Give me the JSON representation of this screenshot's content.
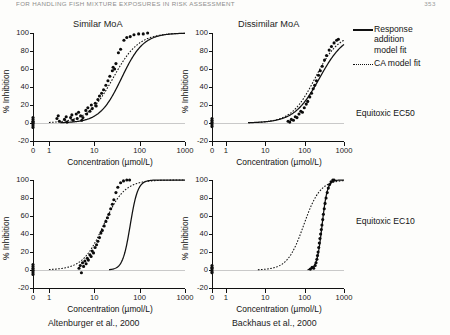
{
  "header": {
    "running_title": "For Handling Fish Mixture Exposures in Risk Assessment",
    "page_number": "353"
  },
  "panel_titles": {
    "left": "Similar MoA",
    "right": "Dissimilar MoA"
  },
  "legend": {
    "response_addition_line1": "Response",
    "response_addition_line2": "addition",
    "response_addition_line3": "model fit",
    "ca_label": "CA model fit",
    "solid_icon": "solid-line-icon",
    "dotted_icon": "dotted-line-icon"
  },
  "row_labels": {
    "top": "Equitoxic EC50",
    "bottom": "Equitoxic EC10"
  },
  "captions": {
    "left": "Altenburger et al., 2000",
    "right": "Backhaus et al., 2000"
  },
  "axes": {
    "xlabel": "Concentration (µmol/L)",
    "ylabel": "% Inhibition",
    "xticks": [
      "0",
      "1",
      "10",
      "100",
      "1000"
    ],
    "yticks": [
      "100",
      "80",
      "60",
      "40",
      "20",
      "0",
      "-20"
    ],
    "ylim": [
      -20,
      100
    ],
    "xscale": "log-with-zero-break"
  },
  "chart_data": [
    {
      "id": "similar-ec50",
      "type": "scatter",
      "title": "Similar MoA",
      "row": "Equitoxic EC50",
      "source": "Altenburger et al., 2000",
      "xlabel": "Concentration (µmol/L)",
      "ylabel": "% Inhibition",
      "ylim": [
        -20,
        100
      ],
      "xticks": [
        0,
        1,
        10,
        100,
        1000
      ],
      "yticks": [
        -20,
        0,
        20,
        40,
        60,
        80,
        100
      ],
      "grid": false,
      "points": [
        {
          "x": 0,
          "y": 2
        },
        {
          "x": 0,
          "y": 0
        },
        {
          "x": 0,
          "y": -1
        },
        {
          "x": 0,
          "y": 4
        },
        {
          "x": 0,
          "y": -3
        },
        {
          "x": 0,
          "y": 1
        },
        {
          "x": 0,
          "y": 6
        },
        {
          "x": 0,
          "y": -5
        },
        {
          "x": 1.5,
          "y": 5
        },
        {
          "x": 1.6,
          "y": 8
        },
        {
          "x": 1.7,
          "y": 2
        },
        {
          "x": 2.2,
          "y": 4
        },
        {
          "x": 2.4,
          "y": 7
        },
        {
          "x": 2.5,
          "y": 1
        },
        {
          "x": 3.0,
          "y": 6
        },
        {
          "x": 3.2,
          "y": 9
        },
        {
          "x": 3.4,
          "y": 3
        },
        {
          "x": 4.0,
          "y": 10
        },
        {
          "x": 4.2,
          "y": 5
        },
        {
          "x": 4.5,
          "y": 12
        },
        {
          "x": 5.0,
          "y": 8
        },
        {
          "x": 5.3,
          "y": 3
        },
        {
          "x": 5.6,
          "y": 6
        },
        {
          "x": 6.5,
          "y": 14
        },
        {
          "x": 6.8,
          "y": 10
        },
        {
          "x": 7.2,
          "y": 17
        },
        {
          "x": 8.0,
          "y": 13
        },
        {
          "x": 8.6,
          "y": 20
        },
        {
          "x": 9.0,
          "y": 16
        },
        {
          "x": 10.5,
          "y": 22
        },
        {
          "x": 11.0,
          "y": 19
        },
        {
          "x": 12.0,
          "y": 26
        },
        {
          "x": 13.0,
          "y": 30
        },
        {
          "x": 14.5,
          "y": 33
        },
        {
          "x": 16.0,
          "y": 37
        },
        {
          "x": 18.0,
          "y": 42
        },
        {
          "x": 20.0,
          "y": 47
        },
        {
          "x": 22.0,
          "y": 52
        },
        {
          "x": 25.0,
          "y": 58
        },
        {
          "x": 26.0,
          "y": 62
        },
        {
          "x": 28.0,
          "y": 60
        },
        {
          "x": 30.0,
          "y": 66
        },
        {
          "x": 34.0,
          "y": 78
        },
        {
          "x": 38.0,
          "y": 82
        },
        {
          "x": 45.0,
          "y": 92
        },
        {
          "x": 52.0,
          "y": 95
        },
        {
          "x": 62.0,
          "y": 96
        },
        {
          "x": 75.0,
          "y": 98
        },
        {
          "x": 95.0,
          "y": 99
        },
        {
          "x": 120.0,
          "y": 99
        },
        {
          "x": 150.0,
          "y": 100
        }
      ],
      "series": [
        {
          "name": "CA model fit",
          "style": "dotted",
          "ec50": 26,
          "slope": 1.55
        },
        {
          "name": "Response addition model fit",
          "style": "solid",
          "ec50": 40,
          "slope": 1.8
        }
      ]
    },
    {
      "id": "dissimilar-ec50",
      "type": "scatter",
      "title": "Dissimilar MoA",
      "row": "Equitoxic EC50",
      "source": "Backhaus et al., 2000",
      "xlabel": "Concentration (µmol/L)",
      "ylabel": "% Inhibition",
      "ylim": [
        -20,
        100
      ],
      "xticks": [
        0,
        1,
        10,
        100,
        1000
      ],
      "yticks": [
        -20,
        0,
        20,
        40,
        60,
        80,
        100
      ],
      "grid": false,
      "points": [
        {
          "x": 0,
          "y": 1
        },
        {
          "x": 0,
          "y": 3
        },
        {
          "x": 0,
          "y": -2
        },
        {
          "x": 0,
          "y": 0
        },
        {
          "x": 0,
          "y": 5
        },
        {
          "x": 0,
          "y": -4
        },
        {
          "x": 38,
          "y": 2
        },
        {
          "x": 42,
          "y": 1
        },
        {
          "x": 46,
          "y": 4
        },
        {
          "x": 52,
          "y": 3
        },
        {
          "x": 58,
          "y": 7
        },
        {
          "x": 64,
          "y": 6
        },
        {
          "x": 72,
          "y": 10
        },
        {
          "x": 80,
          "y": 13
        },
        {
          "x": 88,
          "y": 12
        },
        {
          "x": 98,
          "y": 17
        },
        {
          "x": 110,
          "y": 21
        },
        {
          "x": 120,
          "y": 24
        },
        {
          "x": 135,
          "y": 29
        },
        {
          "x": 150,
          "y": 33
        },
        {
          "x": 165,
          "y": 38
        },
        {
          "x": 180,
          "y": 42
        },
        {
          "x": 200,
          "y": 47
        },
        {
          "x": 225,
          "y": 53
        },
        {
          "x": 250,
          "y": 58
        },
        {
          "x": 280,
          "y": 63
        },
        {
          "x": 320,
          "y": 70
        },
        {
          "x": 360,
          "y": 75
        },
        {
          "x": 420,
          "y": 81
        },
        {
          "x": 480,
          "y": 85
        },
        {
          "x": 560,
          "y": 89
        },
        {
          "x": 650,
          "y": 92
        },
        {
          "x": 720,
          "y": 93
        }
      ],
      "series": [
        {
          "name": "CA model fit",
          "style": "dotted",
          "ec50": 185,
          "slope": 1.45
        },
        {
          "name": "Response addition model fit",
          "style": "solid",
          "ec50": 240,
          "slope": 1.35
        }
      ]
    },
    {
      "id": "similar-ec10",
      "type": "scatter",
      "title": "Similar MoA",
      "row": "Equitoxic EC10",
      "source": "Altenburger et al., 2000",
      "xlabel": "Concentration (µmol/L)",
      "ylabel": "% Inhibition",
      "ylim": [
        -20,
        100
      ],
      "xticks": [
        0,
        1,
        10,
        100,
        1000
      ],
      "yticks": [
        -20,
        0,
        20,
        40,
        60,
        80,
        100
      ],
      "grid": false,
      "points": [
        {
          "x": 0,
          "y": 2
        },
        {
          "x": 0,
          "y": 0
        },
        {
          "x": 0,
          "y": -3
        },
        {
          "x": 0,
          "y": 4
        },
        {
          "x": 0,
          "y": -1
        },
        {
          "x": 0,
          "y": 6
        },
        {
          "x": 0,
          "y": -5
        },
        {
          "x": 4.6,
          "y": 2
        },
        {
          "x": 4.9,
          "y": 5
        },
        {
          "x": 5.2,
          "y": -3
        },
        {
          "x": 5.5,
          "y": 8
        },
        {
          "x": 5.8,
          "y": 4
        },
        {
          "x": 6.2,
          "y": 10
        },
        {
          "x": 6.6,
          "y": 7
        },
        {
          "x": 7.0,
          "y": 13
        },
        {
          "x": 7.4,
          "y": 11
        },
        {
          "x": 8.0,
          "y": 17
        },
        {
          "x": 8.5,
          "y": 15
        },
        {
          "x": 9.0,
          "y": 21
        },
        {
          "x": 9.6,
          "y": 19
        },
        {
          "x": 10.4,
          "y": 25
        },
        {
          "x": 11.2,
          "y": 28
        },
        {
          "x": 12.0,
          "y": 32
        },
        {
          "x": 13.0,
          "y": 36
        },
        {
          "x": 14.0,
          "y": 41
        },
        {
          "x": 15.0,
          "y": 44
        },
        {
          "x": 16.5,
          "y": 49
        },
        {
          "x": 18.0,
          "y": 54
        },
        {
          "x": 19.5,
          "y": 58
        },
        {
          "x": 21.0,
          "y": 62
        },
        {
          "x": 23.0,
          "y": 68
        },
        {
          "x": 25.0,
          "y": 73
        },
        {
          "x": 27.0,
          "y": 78
        },
        {
          "x": 30.0,
          "y": 86
        },
        {
          "x": 33.0,
          "y": 92
        },
        {
          "x": 38.0,
          "y": 97
        },
        {
          "x": 44.0,
          "y": 99
        },
        {
          "x": 52.0,
          "y": 100
        },
        {
          "x": 60.0,
          "y": 100
        }
      ],
      "series": [
        {
          "name": "CA model fit",
          "style": "dotted",
          "ec50": 16,
          "slope": 1.9
        },
        {
          "name": "Response addition model fit",
          "style": "solid",
          "ec50": 62,
          "slope": 5.2
        }
      ]
    },
    {
      "id": "dissimilar-ec10",
      "type": "scatter",
      "title": "Dissimilar MoA",
      "row": "Equitoxic EC10",
      "source": "Backhaus et al., 2000",
      "xlabel": "Concentration (µmol/L)",
      "ylabel": "% Inhibition",
      "ylim": [
        -20,
        100
      ],
      "xticks": [
        0,
        1,
        10,
        100,
        1000
      ],
      "yticks": [
        -20,
        0,
        20,
        40,
        60,
        80,
        100
      ],
      "grid": false,
      "points": [
        {
          "x": 0,
          "y": 2
        },
        {
          "x": 0,
          "y": 0
        },
        {
          "x": 0,
          "y": -3
        },
        {
          "x": 0,
          "y": 5
        },
        {
          "x": 0,
          "y": -2
        },
        {
          "x": 0,
          "y": 3
        },
        {
          "x": 140,
          "y": 1
        },
        {
          "x": 155,
          "y": 3
        },
        {
          "x": 170,
          "y": 2
        },
        {
          "x": 185,
          "y": 5
        },
        {
          "x": 195,
          "y": 8
        },
        {
          "x": 205,
          "y": 12
        },
        {
          "x": 212,
          "y": 16
        },
        {
          "x": 220,
          "y": 20
        },
        {
          "x": 228,
          "y": 25
        },
        {
          "x": 236,
          "y": 30
        },
        {
          "x": 245,
          "y": 35
        },
        {
          "x": 255,
          "y": 40
        },
        {
          "x": 265,
          "y": 45
        },
        {
          "x": 275,
          "y": 50
        },
        {
          "x": 288,
          "y": 56
        },
        {
          "x": 300,
          "y": 62
        },
        {
          "x": 315,
          "y": 68
        },
        {
          "x": 330,
          "y": 74
        },
        {
          "x": 350,
          "y": 80
        },
        {
          "x": 375,
          "y": 86
        },
        {
          "x": 400,
          "y": 91
        },
        {
          "x": 430,
          "y": 95
        },
        {
          "x": 470,
          "y": 98
        },
        {
          "x": 520,
          "y": 100
        },
        {
          "x": 560,
          "y": 100
        }
      ],
      "series": [
        {
          "name": "CA model fit",
          "style": "dotted",
          "ec50": 95,
          "slope": 2.1
        },
        {
          "name": "Response addition model fit",
          "style": "solid",
          "ec50": 278,
          "slope": 6.5
        }
      ]
    }
  ]
}
